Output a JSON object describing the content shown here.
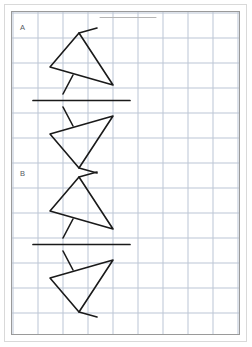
{
  "page": {
    "width": 252,
    "height": 347,
    "background_color": "#ffffff",
    "frame_color": "#9a9a9a",
    "outer_frame_color": "#d9d9d9"
  },
  "grid": {
    "minor_spacing_px": 5,
    "major_spacing_px": 25,
    "minor_color": "#dde3ec",
    "major_color": "#b9c3d2"
  },
  "ink": {
    "color": "#1a1a1a",
    "stroke_width": 1.6,
    "faint_color": "#b5b5b5"
  },
  "sections": [
    {
      "id": "A",
      "label": "A",
      "label_x": 22,
      "label_y": 28,
      "mirror_line": {
        "x1": 33,
        "y1": 100.5,
        "x2": 130,
        "y2": 100.5
      },
      "pre_image": {
        "name": "triangle-with-tails-above",
        "triangle": [
          {
            "x": 79,
            "y": 33
          },
          {
            "x": 50,
            "y": 67
          },
          {
            "x": 113,
            "y": 85
          }
        ],
        "tails": [
          {
            "x1": 79,
            "y1": 33,
            "x2": 97,
            "y2": 28
          },
          {
            "x1": 73,
            "y1": 75,
            "x2": 63,
            "y2": 94
          }
        ]
      },
      "image": {
        "name": "triangle-with-tails-below",
        "triangle": [
          {
            "x": 79,
            "y": 168
          },
          {
            "x": 50,
            "y": 134
          },
          {
            "x": 113,
            "y": 116
          }
        ],
        "tails": [
          {
            "x1": 79,
            "y1": 168,
            "x2": 97,
            "y2": 173
          },
          {
            "x1": 73,
            "y1": 126,
            "x2": 63,
            "y2": 107
          }
        ]
      }
    },
    {
      "id": "B",
      "label": "B",
      "label_x": 22,
      "label_y": 174,
      "mirror_line": {
        "x1": 33,
        "y1": 244.5,
        "x2": 130,
        "y2": 244.5
      },
      "pre_image": {
        "name": "triangle-with-tails-above",
        "triangle": [
          {
            "x": 79,
            "y": 177
          },
          {
            "x": 50,
            "y": 211
          },
          {
            "x": 113,
            "y": 229
          }
        ],
        "tails": [
          {
            "x1": 79,
            "y1": 177,
            "x2": 97,
            "y2": 172
          },
          {
            "x1": 73,
            "y1": 219,
            "x2": 63,
            "y2": 238
          }
        ]
      },
      "image": {
        "name": "triangle-with-tails-below",
        "triangle": [
          {
            "x": 79,
            "y": 312
          },
          {
            "x": 50,
            "y": 278
          },
          {
            "x": 113,
            "y": 260
          }
        ],
        "tails": [
          {
            "x1": 79,
            "y1": 312,
            "x2": 97,
            "y2": 317
          },
          {
            "x1": 73,
            "y1": 270,
            "x2": 63,
            "y2": 251
          }
        ]
      }
    }
  ],
  "stray_marks": [
    {
      "name": "faint-horizontal-rule",
      "x1": 100,
      "y1": 17.5,
      "x2": 156,
      "y2": 17.5
    }
  ]
}
